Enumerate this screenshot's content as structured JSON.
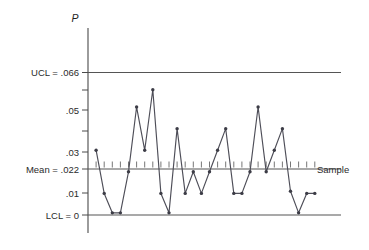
{
  "chart_data": {
    "type": "line",
    "title": "",
    "subtitle": "",
    "xlabel": "Sample",
    "ylabel": "P",
    "grid": false,
    "legend": null,
    "xlim": [
      0,
      28
    ],
    "ylim": [
      0,
      0.075
    ],
    "y_tick_labels": [
      {
        "value": 0.066,
        "text": "UCL = .066"
      },
      {
        "value": 0.05,
        "text": ".05"
      },
      {
        "value": 0.03,
        "text": ".03"
      },
      {
        "value": 0.022,
        "text": "Mean = .022"
      },
      {
        "value": 0.01,
        "text": ".01"
      },
      {
        "value": 0,
        "text": "LCL = 0"
      }
    ],
    "reference_lines": [
      {
        "name": "UCL",
        "label": "UCL = .066",
        "value": 0.066
      },
      {
        "name": "Mean",
        "label": "Mean = .022",
        "value": 0.022
      },
      {
        "name": "LCL",
        "label": "LCL = 0",
        "value": 0
      }
    ],
    "x": [
      1,
      2,
      3,
      4,
      5,
      6,
      7,
      8,
      9,
      10,
      11,
      12,
      13,
      14,
      15,
      16,
      17,
      18,
      19,
      20,
      21,
      22,
      23,
      24,
      25,
      26,
      27,
      28
    ],
    "values": [
      0.03,
      0.01,
      0.001,
      0.001,
      0.02,
      0.05,
      0.03,
      0.058,
      0.01,
      0.001,
      0.04,
      0.01,
      0.02,
      0.01,
      0.02,
      0.03,
      0.04,
      0.01,
      0.01,
      0.02,
      0.05,
      0.02,
      0.03,
      0.04,
      0.011,
      0.001,
      0.01,
      0.01
    ],
    "series": [
      {
        "name": "p",
        "values": [
          0.03,
          0.01,
          0.001,
          0.001,
          0.02,
          0.05,
          0.03,
          0.058,
          0.01,
          0.001,
          0.04,
          0.01,
          0.02,
          0.01,
          0.02,
          0.03,
          0.04,
          0.01,
          0.01,
          0.02,
          0.05,
          0.02,
          0.03,
          0.04,
          0.011,
          0.001,
          0.01,
          0.01
        ]
      }
    ],
    "colors": {
      "line": "#4e4e58",
      "point": "#3c3c46",
      "axis": "#4a4a4a",
      "reference": "#555555",
      "text": "#2b2b2b",
      "background": "#ffffff"
    }
  },
  "labels": {
    "y_axis_title": "P",
    "x_axis_title": "Sample",
    "ucl": "UCL = .066",
    "tick_05": ".05",
    "tick_03": ".03",
    "mean": "Mean = .022",
    "tick_01": ".01",
    "lcl": "LCL = 0"
  }
}
